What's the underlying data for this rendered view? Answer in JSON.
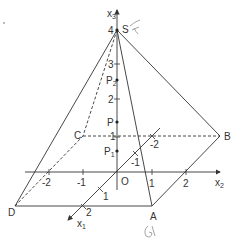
{
  "diagram": {
    "type": "3d-coordinate-pyramid",
    "axes": {
      "x1": {
        "label": "x",
        "sub": "1",
        "ticks": [
          "-2",
          "-1",
          "1",
          "2"
        ]
      },
      "x2": {
        "label": "x",
        "sub": "2",
        "ticks": [
          "-2",
          "-1",
          "1",
          "2"
        ]
      },
      "x3": {
        "label": "x",
        "sub": "3",
        "ticks": [
          "1",
          "2",
          "3",
          "4"
        ]
      }
    },
    "origin_label": "O",
    "vertices": {
      "A": "A",
      "B": "B",
      "C": "C",
      "D": "D",
      "S": "S"
    },
    "points": {
      "P": "P",
      "P1": {
        "label": "P",
        "sub": "1"
      },
      "P2": {
        "label": "P",
        "sub": "2"
      }
    },
    "handwritten": {
      "near_S": "F",
      "near_A": "G"
    },
    "colors": {
      "line": "#333333",
      "handwriting": "#9a9a9a"
    }
  }
}
